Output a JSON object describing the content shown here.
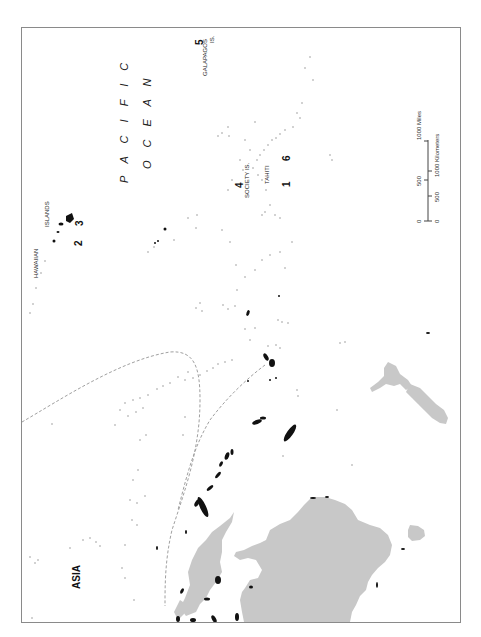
{
  "map": {
    "orientation": "rotated 90 degrees counter-clockwise",
    "colors": {
      "land": "#c8c8c8",
      "islands": "#111111",
      "dotted_islands": "#9a9a9a",
      "dashed_line": "#a0a0a0",
      "frame": "#8a8a8a"
    },
    "labels": {
      "ocean_line1": "P A C I F I C",
      "ocean_line2": "O C E A N",
      "asia": "ASIA",
      "hawaiian": "HAWAIIAN",
      "islands": "ISLANDS",
      "society": "SOCIETY IS.",
      "tahiti": "TAHITI",
      "galapagos": "GALAPAGOS",
      "galapagos_is": "IS."
    },
    "markers": [
      {
        "id": "1",
        "label": "1"
      },
      {
        "id": "2",
        "label": "2"
      },
      {
        "id": "3",
        "label": "3"
      },
      {
        "id": "4",
        "label": "4"
      },
      {
        "id": "5",
        "label": "5"
      },
      {
        "id": "6",
        "label": "6"
      }
    ],
    "scale_bar": {
      "miles_label": "1000 Miles",
      "miles_ticks": [
        "0",
        "500"
      ],
      "km_label": "1000 Kilometers",
      "km_ticks": [
        "0",
        "500"
      ]
    }
  }
}
